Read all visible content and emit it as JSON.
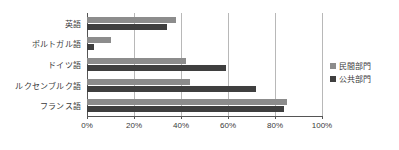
{
  "chart_data": {
    "type": "bar",
    "orientation": "horizontal",
    "title": "",
    "xlabel": "",
    "ylabel": "",
    "xlim": [
      0,
      100
    ],
    "grid": true,
    "legend_position": "right",
    "categories": [
      "英語",
      "ポルトガル語",
      "ドイツ語",
      "ルクセンブルク語",
      "フランス語"
    ],
    "series": [
      {
        "name": "民間部門",
        "color": "#8c8c8c",
        "values": [
          38,
          10,
          42,
          44,
          85
        ]
      },
      {
        "name": "公共部門",
        "color": "#3f3f3f",
        "values": [
          34,
          3,
          59,
          72,
          84
        ]
      }
    ],
    "tick_labels": [
      "0%",
      "20%",
      "40%",
      "60%",
      "80%",
      "100%"
    ],
    "tick_values": [
      0,
      20,
      40,
      60,
      80,
      100
    ]
  },
  "legend": {
    "items": [
      {
        "label": "民間部門",
        "color": "#8c8c8c"
      },
      {
        "label": "公共部門",
        "color": "#3f3f3f"
      }
    ]
  },
  "colors": {
    "private_sector": "#8c8c8c",
    "public_sector": "#3f3f3f",
    "gridline": "#b8b8b8",
    "axis": "#555555",
    "background": "#ffffff",
    "text": "#3a3a3a"
  }
}
